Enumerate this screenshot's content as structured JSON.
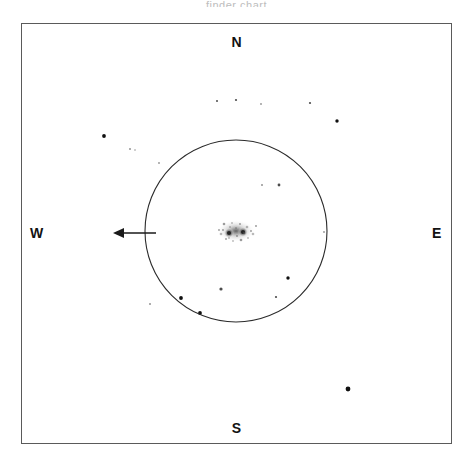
{
  "title": {
    "text": "finder chart",
    "visible_fragment": "(clipped at top edge)"
  },
  "compass": {
    "north": "N",
    "south": "S",
    "east": "E",
    "west": "W"
  },
  "frame": {
    "x": 21,
    "y": 23,
    "width": 431,
    "height": 421,
    "stroke": "#5a5a5a",
    "fill": "#ffffff"
  },
  "chart_data": {
    "type": "scatter",
    "title": "",
    "xlabel": "",
    "ylabel": "",
    "subtitle": "Astronomical finder chart — sky field with search circle and position arrow",
    "grid": false,
    "legend": null,
    "xlim": [
      21,
      452
    ],
    "ylim": [
      23,
      444
    ],
    "orientation": {
      "north": "up",
      "south": "down",
      "east": "right",
      "west": "left"
    },
    "circle": {
      "name": "field-of-view-circle",
      "cx": 236,
      "cy": 231,
      "r": 91,
      "stroke": "#2b2b2b",
      "stroke_width": 1.1,
      "fill": "none"
    },
    "arrow": {
      "name": "target-pointer-arrow",
      "direction": "west",
      "x_start": 156,
      "x_end": 113,
      "y": 233,
      "stroke": "#1a1a1a",
      "stroke_width": 1.6,
      "head_length": 11,
      "head_half_width": 5
    },
    "target_object": {
      "name": "central-extended-object",
      "cx": 236,
      "cy": 231,
      "rx": 19,
      "ry": 11,
      "shape": "elongated diffuse blob with two bright cores",
      "cores": [
        {
          "x": 229,
          "y": 233,
          "r": 2.1
        },
        {
          "x": 243,
          "y": 232,
          "r": 2.1
        }
      ],
      "color": "#6e6e6e"
    },
    "points": [
      {
        "x": 217,
        "y": 101,
        "r": 1.0,
        "mag": "faint"
      },
      {
        "x": 236,
        "y": 100,
        "r": 1.1,
        "mag": "faint"
      },
      {
        "x": 261,
        "y": 104,
        "r": 0.9,
        "mag": "very-faint"
      },
      {
        "x": 310,
        "y": 103,
        "r": 1.1,
        "mag": "faint"
      },
      {
        "x": 337,
        "y": 121,
        "r": 1.7,
        "mag": "medium"
      },
      {
        "x": 104,
        "y": 136,
        "r": 1.9,
        "mag": "medium"
      },
      {
        "x": 130,
        "y": 149,
        "r": 1.0,
        "mag": "very-faint"
      },
      {
        "x": 135,
        "y": 150,
        "r": 0.8,
        "mag": "very-faint"
      },
      {
        "x": 159,
        "y": 163,
        "r": 0.9,
        "mag": "very-faint"
      },
      {
        "x": 262,
        "y": 185,
        "r": 1.0,
        "mag": "very-faint"
      },
      {
        "x": 279,
        "y": 185,
        "r": 1.4,
        "mag": "faint"
      },
      {
        "x": 256,
        "y": 226,
        "r": 0.9,
        "mag": "very-faint"
      },
      {
        "x": 324,
        "y": 232,
        "r": 0.9,
        "mag": "very-faint"
      },
      {
        "x": 150,
        "y": 304,
        "r": 1.0,
        "mag": "very-faint"
      },
      {
        "x": 181,
        "y": 298,
        "r": 1.9,
        "mag": "medium"
      },
      {
        "x": 200,
        "y": 313,
        "r": 1.9,
        "mag": "medium"
      },
      {
        "x": 221,
        "y": 289,
        "r": 1.6,
        "mag": "faint"
      },
      {
        "x": 276,
        "y": 297,
        "r": 1.1,
        "mag": "faint"
      },
      {
        "x": 288,
        "y": 278,
        "r": 1.7,
        "mag": "medium"
      },
      {
        "x": 348,
        "y": 389,
        "r": 2.4,
        "mag": "bright"
      }
    ],
    "point_color": "#101010"
  }
}
